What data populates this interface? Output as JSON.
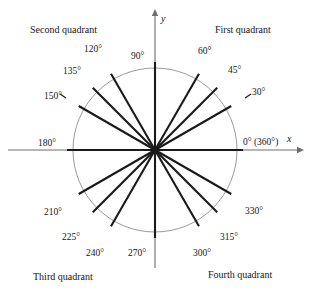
{
  "figure": {
    "center": {
      "x": 155,
      "y": 150
    },
    "radius": 82,
    "colors": {
      "circle": "#8f8f8f",
      "axis": "#6e6e6e",
      "ray": "#1a1a1a",
      "text": "#161616",
      "background": "#ffffff"
    },
    "axes": {
      "x_name": "x",
      "y_name": "y",
      "x_arrow_tip": 300,
      "y_arrow_tip": 13
    },
    "quadrants": [
      {
        "name": "quadrant-2-label",
        "text": "Second quadrant",
        "x": 30,
        "y": 25
      },
      {
        "name": "quadrant-1-label",
        "text": "First quadrant",
        "x": 215,
        "y": 25
      },
      {
        "name": "quadrant-3-label",
        "text": "Third quadrant",
        "x": 33,
        "y": 272
      },
      {
        "name": "quadrant-4-label",
        "text": "Fourth quadrant",
        "x": 208,
        "y": 270
      }
    ],
    "angles": [
      {
        "deg": 0,
        "label": "0° (360°)",
        "lx": 243,
        "ly": 138,
        "thick": true
      },
      {
        "deg": 30,
        "label": "30°",
        "lx": 252,
        "ly": 88,
        "thick": true
      },
      {
        "deg": 45,
        "label": "45°",
        "lx": 228,
        "ly": 66,
        "thick": true
      },
      {
        "deg": 60,
        "label": "60°",
        "lx": 198,
        "ly": 47,
        "thick": true
      },
      {
        "deg": 90,
        "label": "90°",
        "lx": 131,
        "ly": 52,
        "thick": true
      },
      {
        "deg": 120,
        "label": "120°",
        "lx": 84,
        "ly": 45,
        "thick": true
      },
      {
        "deg": 135,
        "label": "135°",
        "lx": 63,
        "ly": 67,
        "thick": true
      },
      {
        "deg": 150,
        "label": "150°",
        "lx": 44,
        "ly": 92,
        "thick": true
      },
      {
        "deg": 180,
        "label": "180°",
        "lx": 38,
        "ly": 139,
        "thick": true
      },
      {
        "deg": 210,
        "label": "210°",
        "lx": 44,
        "ly": 208,
        "thick": true
      },
      {
        "deg": 225,
        "label": "225°",
        "lx": 62,
        "ly": 233,
        "thick": true
      },
      {
        "deg": 240,
        "label": "240°",
        "lx": 86,
        "ly": 249,
        "thick": true
      },
      {
        "deg": 270,
        "label": "270°",
        "lx": 128,
        "ly": 249,
        "thick": true
      },
      {
        "deg": 300,
        "label": "300°",
        "lx": 193,
        "ly": 249,
        "thick": true
      },
      {
        "deg": 315,
        "label": "315°",
        "lx": 220,
        "ly": 233,
        "thick": true
      },
      {
        "deg": 330,
        "label": "330°",
        "lx": 245,
        "ly": 207,
        "thick": true
      }
    ]
  },
  "chart_data": {
    "type": "scatter",
    "xlabel": "x",
    "ylabel": "y",
    "categories": [
      "0° (360°)",
      "30°",
      "45°",
      "60°",
      "90°",
      "120°",
      "135°",
      "150°",
      "180°",
      "210°",
      "225°",
      "240°",
      "270°",
      "300°",
      "315°",
      "330°"
    ],
    "values": [
      0,
      30,
      45,
      60,
      90,
      120,
      135,
      150,
      180,
      210,
      225,
      240,
      270,
      300,
      315,
      330
    ],
    "annotations": [
      "Second quadrant",
      "First quadrant",
      "Third quadrant",
      "Fourth quadrant"
    ],
    "grid": false,
    "legend": "none"
  }
}
